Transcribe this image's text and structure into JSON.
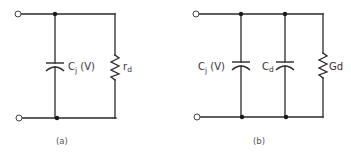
{
  "diagram": {
    "type": "equivalent-circuit",
    "circuits": [
      {
        "id": "a",
        "caption": "(a)",
        "components": [
          {
            "kind": "capacitor",
            "label_main": "C",
            "label_sub": "j",
            "label_suffix": " (V)"
          },
          {
            "kind": "resistor",
            "label_main": "r",
            "label_sub": "d"
          }
        ],
        "terminals": 2,
        "topology": "parallel"
      },
      {
        "id": "b",
        "caption": "(b)",
        "components": [
          {
            "kind": "capacitor",
            "label_main": "C",
            "label_sub": "j",
            "label_suffix": " (V)"
          },
          {
            "kind": "capacitor",
            "label_main": "C",
            "label_sub": "d",
            "label_suffix": ""
          },
          {
            "kind": "resistor",
            "label_main": "G",
            "label_sub": "d"
          }
        ],
        "terminals": 2,
        "topology": "parallel"
      }
    ],
    "colors": {
      "line": "#2a2a2a",
      "background": "#ffffff"
    }
  }
}
